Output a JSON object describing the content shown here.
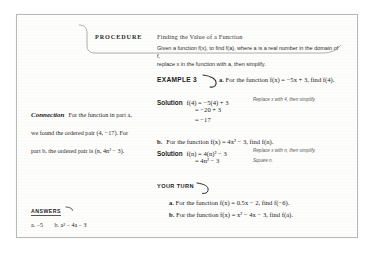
{
  "procedure": {
    "label": "PROCEDURE",
    "title": "Finding the Value of a Function",
    "body_line1": "Given a function f(x), to find f(a), where a is a real number in the domain of f,",
    "body_line2": "replace x in the function with a, then simplify."
  },
  "example": {
    "label": "EXAMPLE 3",
    "part_a_letter": "a.",
    "part_a_text": "For the function f(x) = −5x + 3, find f(4).",
    "part_b_letter": "b.",
    "part_b_text": "For the function f(x) = 4x² − 3, find f(n)."
  },
  "solution_a": {
    "word": "Solution",
    "line1": "f(4) = −5(4) + 3",
    "line1_annot": "Replace x with 4, then simplify.",
    "line2": "= −20 + 3",
    "line3": "= −17"
  },
  "solution_b": {
    "word": "Solution",
    "line1": "f(n) = 4(n)² − 3",
    "line1_annot": "Replace x with n, then simplify.",
    "line2": "= 4n² − 3",
    "line2_annot": "Square n."
  },
  "your_turn": {
    "label": "YOUR TURN",
    "item_a_letter": "a.",
    "item_a_text": "For the function f(x) = 0.5x − 2, find f(−6).",
    "item_b_letter": "b.",
    "item_b_text": "For the function f(x) = x² − 4x − 3, find f(a)."
  },
  "connection": {
    "title": "Connection",
    "text": "For the function in part a, we found the ordered pair (4, −17). For part b, the ordered pair is (n, 4n² − 3)."
  },
  "answers": {
    "label": "ANSWERS",
    "answer_a": "a. −5",
    "answer_b": "b. a² − 4a − 3"
  },
  "colors": {
    "page_background": "#fdfdfc",
    "page_border": "#b9b9b9",
    "text": "#1d1d1d",
    "annotation": "#5a5a5a",
    "rule": "#9a9a9a"
  }
}
